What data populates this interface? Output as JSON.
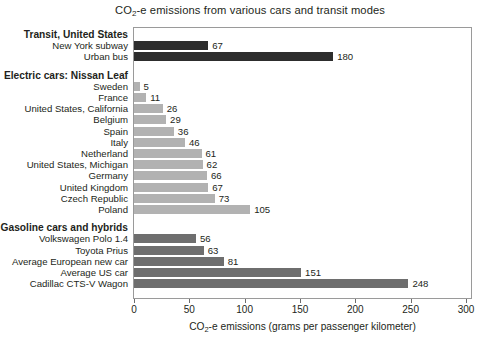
{
  "chart_data": {
    "type": "bar",
    "orientation": "horizontal",
    "title": "CO2-e emissions from various cars and transit modes",
    "title_parts": {
      "pre": "CO",
      "sub": "2",
      "post": "-e emissions from various cars and transit modes"
    },
    "xlabel": "CO2-e emissions (grams per passenger kilometer)",
    "xlabel_parts": {
      "pre": "CO",
      "sub": "2",
      "post": "-e emissions (grams per passenger kilometer)"
    },
    "ylabel": "",
    "xlim": [
      0,
      300
    ],
    "xticks": [
      0,
      50,
      100,
      150,
      200,
      250,
      300
    ],
    "xtick_labels": [
      "0",
      "50",
      "100",
      "150",
      "200",
      "250",
      "300"
    ],
    "grid": false,
    "legend": "none",
    "groups": [
      {
        "name": "Transit, United States",
        "color": "#2d2d2d",
        "categories": [
          "New York subway",
          "Urban bus"
        ],
        "values": [
          67,
          180
        ]
      },
      {
        "name": "Electric cars: Nissan Leaf",
        "color": "#b2b2b2",
        "categories": [
          "Sweden",
          "France",
          "United States, California",
          "Belgium",
          "Spain",
          "Italy",
          "Netherland",
          "United States, Michigan",
          "Germany",
          "United Kingdom",
          "Czech Republic",
          "Poland"
        ],
        "values": [
          5,
          11,
          26,
          29,
          36,
          46,
          61,
          62,
          66,
          67,
          73,
          105
        ]
      },
      {
        "name": "Gasoline cars and hybrids",
        "color": "#6e6e6e",
        "categories": [
          "Volkswagen Polo 1.4",
          "Toyota Prius",
          "Average European new car",
          "Average US car",
          "Cadillac CTS-V Wagon"
        ],
        "values": [
          56,
          63,
          81,
          151,
          248
        ]
      }
    ]
  }
}
